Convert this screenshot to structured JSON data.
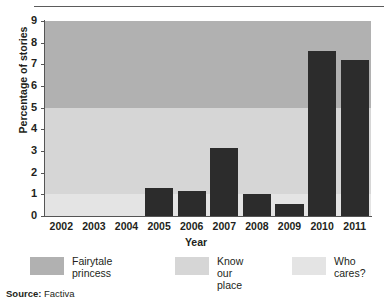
{
  "figure": {
    "source_label": "Source:",
    "source_value": "Factiva"
  },
  "chart_data": {
    "type": "bar",
    "title": "",
    "xlabel": "Year",
    "ylabel": "Percentage of stories",
    "categories": [
      "2002",
      "2003",
      "2004",
      "2005",
      "2006",
      "2007",
      "2008",
      "2009",
      "2010",
      "2011"
    ],
    "values": [
      0,
      0,
      0,
      1.3,
      1.15,
      3.15,
      1.0,
      0.55,
      7.6,
      7.2
    ],
    "ylim": [
      0,
      9
    ],
    "yticks": [
      0,
      1,
      2,
      3,
      4,
      5,
      6,
      7,
      8,
      9
    ],
    "ytick_labels": [
      "0",
      "1",
      "2",
      "3",
      "4",
      "5",
      "6",
      "7",
      "8",
      "9"
    ],
    "grid": false,
    "bar_color": "#2c2c2c",
    "legend_position": "below",
    "background_bands": [
      {
        "name": "Fairytale princess",
        "from": 5,
        "to": 9,
        "color": "#b1b1b1"
      },
      {
        "name": "Know our place",
        "from": 1,
        "to": 5,
        "color": "#d6d6d6"
      },
      {
        "name": "Who cares?",
        "from": 0,
        "to": 1,
        "color": "#e4e4e4"
      }
    ],
    "legend": [
      {
        "label": "Fairytale\nprincess",
        "color": "#b1b1b1"
      },
      {
        "label": "Know our\nplace",
        "color": "#d6d6d6"
      },
      {
        "label": "Who\ncares?",
        "color": "#e4e4e4"
      }
    ]
  }
}
